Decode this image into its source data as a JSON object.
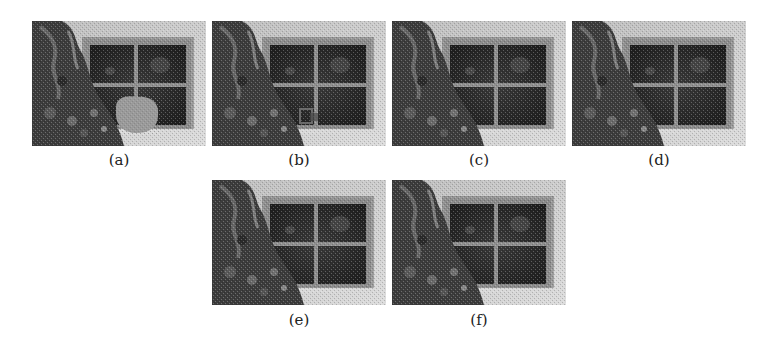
{
  "figure": {
    "panels": [
      {
        "id": "a",
        "label": "(a)",
        "variant": "masked-input",
        "has_mask": true,
        "has_artifact": false
      },
      {
        "id": "b",
        "label": "(b)",
        "variant": "result",
        "has_mask": false,
        "has_artifact": true
      },
      {
        "id": "c",
        "label": "(c)",
        "variant": "result",
        "has_mask": false,
        "has_artifact": false
      },
      {
        "id": "d",
        "label": "(d)",
        "variant": "result",
        "has_mask": false,
        "has_artifact": false
      },
      {
        "id": "e",
        "label": "(e)",
        "variant": "result",
        "has_mask": false,
        "has_artifact": false
      },
      {
        "id": "f",
        "label": "(f)",
        "variant": "result",
        "has_mask": false,
        "has_artifact": false
      }
    ],
    "colors": {
      "wall": "#c8c8c8",
      "window_glass": "#2e2e2e",
      "window_frame": "#8c8c8c",
      "plant_dark": "#3a3a3a",
      "plant_light": "#7a7a7a",
      "mask": "#9a9a9a"
    }
  }
}
